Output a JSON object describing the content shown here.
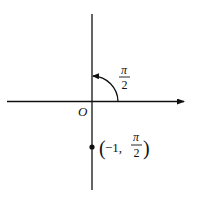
{
  "diagram": {
    "type": "polar-coordinate-plot",
    "origin_label": "O",
    "angle_label": {
      "numerator": "π",
      "denominator": "2"
    },
    "point": {
      "r": "−1",
      "theta_numerator": "π",
      "theta_denominator": "2",
      "open_paren": "(",
      "close_paren": ")",
      "r_text": "−1,"
    },
    "colors": {
      "stroke": "#111111",
      "background": "#ffffff"
    }
  }
}
